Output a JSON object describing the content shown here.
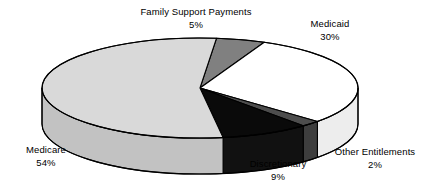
{
  "chart_data": {
    "type": "pie",
    "title": "",
    "subtitle": "",
    "xlabel": "",
    "ylabel": "",
    "legend_position": "none",
    "grid": false,
    "three_d": true,
    "value_unit": "%",
    "total": 100,
    "categories": [
      "Family Support Payments",
      "Medicaid",
      "Other Entitlements",
      "Discretionary",
      "Medicare"
    ],
    "values": [
      5,
      30,
      2,
      9,
      54
    ],
    "value_labels": [
      "5%",
      "30%",
      "2%",
      "9%",
      "54%"
    ],
    "colors": [
      "#808080",
      "#ffffff",
      "#4d4d4d",
      "#0a0a0a",
      "#d9d9d9"
    ],
    "slices": [
      {
        "name": "Family Support Payments",
        "value": 5,
        "value_label": "5%",
        "color": "#808080",
        "side_color": "#6a6a6a",
        "label_x": 196,
        "label_y": 6,
        "label_align": "center"
      },
      {
        "name": "Medicaid",
        "value": 30,
        "value_label": "30%",
        "color": "#ffffff",
        "side_color": "#ededed",
        "label_x": 330,
        "label_y": 18,
        "label_align": "center"
      },
      {
        "name": "Other Entitlements",
        "value": 2,
        "value_label": "2%",
        "color": "#4d4d4d",
        "side_color": "#3d3d3d",
        "label_x": 375,
        "label_y": 146,
        "label_align": "center"
      },
      {
        "name": "Discretionary",
        "value": 9,
        "value_label": "9%",
        "color": "#0a0a0a",
        "side_color": "#111111",
        "label_x": 278,
        "label_y": 158,
        "label_align": "center"
      },
      {
        "name": "Medicare",
        "value": 54,
        "value_label": "54%",
        "color": "#d9d9d9",
        "side_color": "#c2c2c2",
        "label_x": 46,
        "label_y": 144,
        "label_align": "center"
      }
    ],
    "geometry": {
      "cx": 200,
      "cy": 88,
      "rx": 158,
      "ry": 50,
      "depth": 36,
      "start_angle_deg": -84,
      "direction": "clockwise",
      "outline_color": "#000000",
      "outline_width": 1.1
    }
  }
}
